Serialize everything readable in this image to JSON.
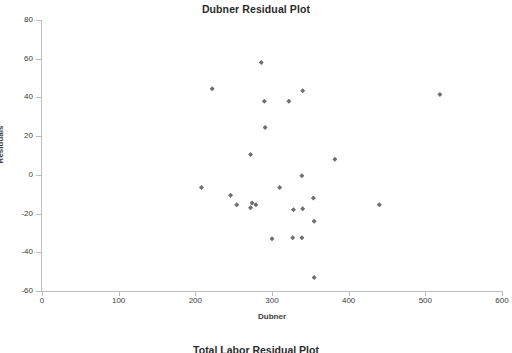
{
  "chart_data": {
    "type": "scatter",
    "title": "Dubner Residual Plot",
    "xlabel": "Dubner",
    "ylabel": "Residuals",
    "xlim": [
      0,
      600
    ],
    "ylim": [
      -60,
      80
    ],
    "xticks": [
      0,
      100,
      200,
      300,
      400,
      500,
      600
    ],
    "yticks": [
      -60,
      -40,
      -20,
      0,
      20,
      40,
      60,
      80
    ],
    "grid": false,
    "legend": false,
    "marker": "diamond",
    "marker_color": "#6e6e73",
    "points": [
      {
        "x": 286,
        "y": 58
      },
      {
        "x": 222,
        "y": 44.5
      },
      {
        "x": 340,
        "y": 43.5
      },
      {
        "x": 519,
        "y": 41.5
      },
      {
        "x": 290,
        "y": 38
      },
      {
        "x": 322,
        "y": 38
      },
      {
        "x": 291,
        "y": 24.5
      },
      {
        "x": 272,
        "y": 10.5
      },
      {
        "x": 382,
        "y": 8
      },
      {
        "x": 339,
        "y": -0.5
      },
      {
        "x": 208,
        "y": -6.5
      },
      {
        "x": 310,
        "y": -6.5
      },
      {
        "x": 246,
        "y": -10.5
      },
      {
        "x": 354,
        "y": -12
      },
      {
        "x": 254,
        "y": -15.5
      },
      {
        "x": 440,
        "y": -15.5
      },
      {
        "x": 274,
        "y": -14.5
      },
      {
        "x": 279,
        "y": -15.5
      },
      {
        "x": 272,
        "y": -17
      },
      {
        "x": 328,
        "y": -18
      },
      {
        "x": 340,
        "y": -17.5
      },
      {
        "x": 355,
        "y": -24
      },
      {
        "x": 300,
        "y": -33
      },
      {
        "x": 327,
        "y": -32.5
      },
      {
        "x": 339,
        "y": -32.5
      },
      {
        "x": 355,
        "y": -53
      }
    ]
  },
  "axis": {
    "y_tick_labels": [
      "80",
      "60",
      "40",
      "20",
      "0",
      "-20",
      "-40",
      "-60"
    ],
    "x_tick_labels": [
      "0",
      "100",
      "200",
      "300",
      "400",
      "500",
      "600"
    ]
  },
  "next_chart": {
    "title": "Total Labor Residual Plot"
  }
}
